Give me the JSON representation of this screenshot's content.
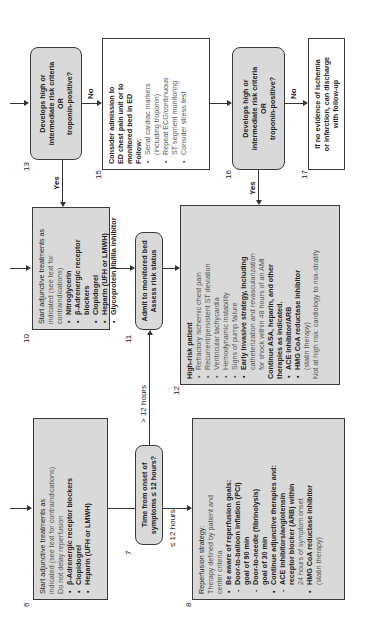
{
  "diagram": {
    "orientation": "rotated 90 degrees counter-clockwise",
    "nodes": {
      "n6": {
        "number": "6",
        "line1": "Start adjunctive treatments as",
        "line2": "indicated (see text for contraindications)",
        "line3": "Do not delay reperfusion",
        "items": [
          "β-Adrenergic receptor blockers",
          "Clopidogrel",
          "Heparin (UFH or LMWH)"
        ]
      },
      "n7": {
        "number": "7",
        "line1": "Time from onset of",
        "line2": "symptoms ≤ 12 hours?"
      },
      "n8": {
        "number": "8",
        "title": "Reperfusion strategy:",
        "sub1": "Therapy defined by patient and",
        "sub2": "center criteria",
        "b1": "Be aware of reperfusion goals:",
        "b1a": "Door-to-balloon inflation (PCI)",
        "b1a2": "goal of 90 min",
        "b1b": "Door-to-needle (fibrinolysis)",
        "b1b2": "goal of 30 min",
        "b2": "Continue adjunctive therapies and:",
        "b2a": "ACE inhibitors/angiotensin",
        "b2a2": "receptor blocker (ARB) within",
        "b2a3": "24 hours of symptom onset",
        "b3": "HMG CoA reductase inhibitor",
        "b3a": "(statin therapy)"
      },
      "n10": {
        "number": "10",
        "line1": "Start adjunctive treatments as",
        "line2": "indicated (see text for contraindications)",
        "items": [
          "Nitroglycerin",
          "β-Adrenergic receptor blockers",
          "Clopidogrel",
          "Heparin (UFH or LMWH)",
          "Glycoprotein IIb/IIIa inhibitor"
        ]
      },
      "n11": {
        "number": "11",
        "line1": "Admit to monitored bed",
        "line2": "Assess risk status"
      },
      "n12": {
        "number": "12",
        "title": "High-risk patient",
        "items": [
          "Refractory ischemic chest pain",
          "Recurrent/persistent ST deviation",
          "Ventricular tachycardia",
          "Hemodynamic instability",
          "Signs of pump failure"
        ],
        "early1": "Early invasive strategy, including",
        "early2": "catheterization and revascularization",
        "early3": "for shock within 48 hours of an AMI",
        "cont1": "Continue ASA, heparin, and other",
        "cont2": "therapies as indicated.",
        "ace": "ACE inhibitor/ARB",
        "hmg": "HMG CoA reductase inhibitor",
        "statin": "(statin therapy)",
        "notHigh": "Not at high risk: cardiology to risk-stratify"
      },
      "n13": {
        "number": "13",
        "line1": "Develops high or",
        "line2": "intermediate risk criteria",
        "line3": "OR",
        "line4": "troponin-positive?"
      },
      "n15": {
        "number": "15",
        "line1": "Consider admission to",
        "line2": "ED chest pain unit or to",
        "line3": "monitored  bed in ED",
        "line4": "Follow:",
        "i1": "Serial cardiac markers",
        "i1b": "(including troponin)",
        "i2": "Repeat ECG/continuous",
        "i2b": "ST segment monitoring",
        "i3": "Consider stress test"
      },
      "n16": {
        "number": "16",
        "line1": "Develops high or",
        "line2": "intermediate risk criteria",
        "line3": "OR",
        "line4": "troponin-positive?"
      },
      "n17": {
        "number": "17",
        "line1": "If no evidence of ischemia",
        "line2": "or infarction, can discharge",
        "line3": "with follow-up"
      }
    },
    "edge_labels": {
      "yes13": "Yes",
      "no13": "No",
      "yes16": "Yes",
      "no16": "No",
      "gt12": "> 12 hours",
      "le12": "≤ 12 hours"
    },
    "colors": {
      "box_fill": "#d9d9d9",
      "border": "#3a3a3a",
      "white_fill": "#ffffff"
    }
  }
}
